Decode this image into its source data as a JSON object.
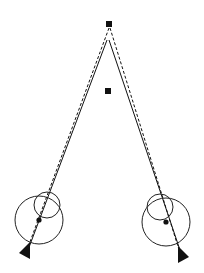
{
  "diagram": {
    "title": "",
    "background": "#ffffff",
    "stroke_color": "#111111",
    "target_far": {
      "x": 109,
      "y": 24,
      "size": 6
    },
    "target_near": {
      "x": 108,
      "y": 91,
      "size": 6
    },
    "left_eye": {
      "center": {
        "x": 39,
        "y": 220
      },
      "radius": 24,
      "cornea": {
        "x": 47,
        "y": 205,
        "r": 13
      },
      "pupil_dot": {
        "x": 39,
        "y": 220,
        "r": 2.6
      },
      "marker_triangle": {
        "x": 27,
        "y": 251
      }
    },
    "right_eye": {
      "center": {
        "x": 166,
        "y": 222
      },
      "radius": 24,
      "cornea": {
        "x": 160,
        "y": 207,
        "r": 13
      },
      "pupil_dot": {
        "x": 166,
        "y": 222,
        "r": 2.6
      },
      "marker_triangle": {
        "x": 181,
        "y": 255
      }
    },
    "lines": [
      {
        "name": "left-solid-line",
        "x1": 107,
        "y1": 40,
        "x2": 28,
        "y2": 250,
        "style": "solid"
      },
      {
        "name": "left-dashed-line",
        "x1": 109,
        "y1": 28,
        "x2": 27,
        "y2": 250,
        "style": "dashed"
      },
      {
        "name": "right-solid-line",
        "x1": 109,
        "y1": 40,
        "x2": 181,
        "y2": 253,
        "style": "solid"
      },
      {
        "name": "right-dashed-line",
        "x1": 110,
        "y1": 28,
        "x2": 180,
        "y2": 253,
        "style": "dashed"
      }
    ]
  }
}
